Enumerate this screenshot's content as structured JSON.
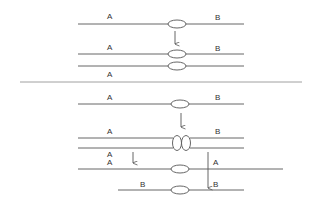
{
  "colors": {
    "line": "#555555",
    "background": "#ffffff",
    "text": "#333333"
  },
  "top_panel": {
    "row1": {
      "left_label": "A",
      "right_label": "B"
    },
    "row2": {
      "left_label": "A",
      "right_label": "B"
    },
    "row3": {
      "left_label": "A"
    }
  },
  "bottom_panel": {
    "row1": {
      "left_label": "A",
      "right_label": "B"
    },
    "row2": {
      "left_label": "A",
      "right_label": "B"
    },
    "row3": {
      "left_label": "A"
    },
    "row4": {
      "left_label": "A",
      "right_label": "A"
    },
    "row5": {
      "left_label": "B",
      "right_label": "B"
    }
  }
}
